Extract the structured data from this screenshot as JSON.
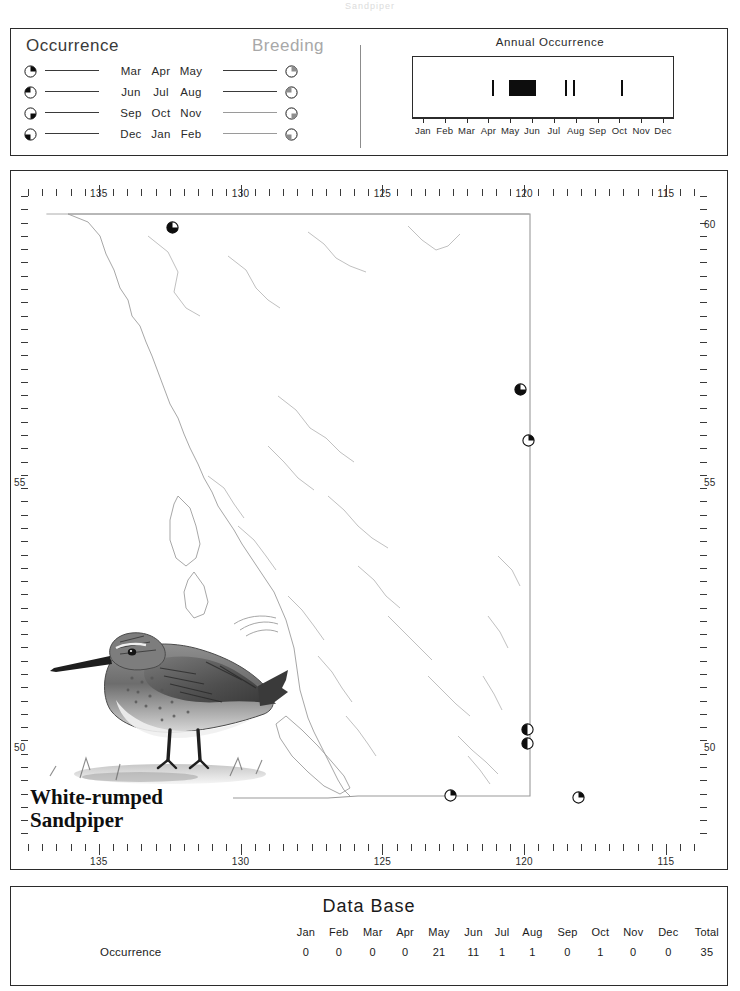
{
  "header": {
    "cropped_text": "Sandpiper"
  },
  "legend": {
    "occurrence_title": "Occurrence",
    "breeding_title": "Breeding",
    "rows": [
      {
        "months": [
          "Mar",
          "Apr",
          "May"
        ],
        "icon": "pie-quadrant-top-right-icon",
        "quadrant": "top-right"
      },
      {
        "months": [
          "Jun",
          "Jul",
          "Aug"
        ],
        "icon": "pie-quadrant-top-left-icon",
        "quadrant": "top-left"
      },
      {
        "months": [
          "Sep",
          "Oct",
          "Nov"
        ],
        "icon": "pie-quadrant-bottom-right-icon",
        "quadrant": "bottom-right"
      },
      {
        "months": [
          "Dec",
          "Jan",
          "Feb"
        ],
        "icon": "pie-quadrant-bottom-left-icon",
        "quadrant": "bottom-left"
      }
    ],
    "occurrence_color": "#0d0d0d",
    "breeding_color": "#8e8e8e"
  },
  "chart_data": {
    "type": "bar",
    "title": "Annual Occurrence",
    "xlabel": "",
    "ylabel": "",
    "categories": [
      "Jan",
      "Feb",
      "Mar",
      "Apr",
      "May",
      "Jun",
      "Jul",
      "Aug",
      "Sep",
      "Oct",
      "Nov",
      "Dec"
    ],
    "values": [
      0,
      0,
      0,
      0,
      21,
      11,
      1,
      1,
      0,
      1,
      0,
      0
    ],
    "ylim": [
      0,
      25
    ],
    "grid": false,
    "legend": "none",
    "marks": [
      {
        "label": "late Apr",
        "left_pct": 30.5,
        "width_px": 2,
        "height_px": 16
      },
      {
        "label": "May-Jun",
        "left_pct": 37.0,
        "width_px": 27,
        "height_px": 16
      },
      {
        "label": "Jul",
        "left_pct": 58.5,
        "width_px": 2,
        "height_px": 16
      },
      {
        "label": "Jul-Aug",
        "left_pct": 61.4,
        "width_px": 2,
        "height_px": 16
      },
      {
        "label": "Oct",
        "left_pct": 80.0,
        "width_px": 2,
        "height_px": 16
      }
    ]
  },
  "map": {
    "longitude_labels": [
      "135",
      "130",
      "125",
      "120",
      "115"
    ],
    "latitude_labels": [
      "60",
      "55",
      "50"
    ],
    "markers": [
      {
        "x": 172,
        "y": 227,
        "quadrant": "top-right",
        "fill": "full"
      },
      {
        "x": 520,
        "y": 389,
        "quadrant": "top-right",
        "fill": "full"
      },
      {
        "x": 528,
        "y": 440,
        "quadrant": "top-right",
        "fill": "wedge"
      },
      {
        "x": 450,
        "y": 795,
        "quadrant": "top-right",
        "fill": "wedge"
      },
      {
        "x": 527,
        "y": 729,
        "quadrant": "top-left",
        "fill": "half"
      },
      {
        "x": 527,
        "y": 743,
        "quadrant": "top-left",
        "fill": "half"
      },
      {
        "x": 578,
        "y": 797,
        "quadrant": "top-right",
        "fill": "wedge"
      }
    ],
    "species_common_name_line1": "White-rumped",
    "species_common_name_line2": "Sandpiper"
  },
  "database": {
    "title": "Data Base",
    "columns": [
      "Jan",
      "Feb",
      "Mar",
      "Apr",
      "May",
      "Jun",
      "Jul",
      "Aug",
      "Sep",
      "Oct",
      "Nov",
      "Dec",
      "Total"
    ],
    "rows": [
      {
        "label": "Occurrence",
        "values": [
          "0",
          "0",
          "0",
          "0",
          "21",
          "11",
          "1",
          "1",
          "0",
          "1",
          "0",
          "0",
          "35"
        ]
      }
    ]
  }
}
